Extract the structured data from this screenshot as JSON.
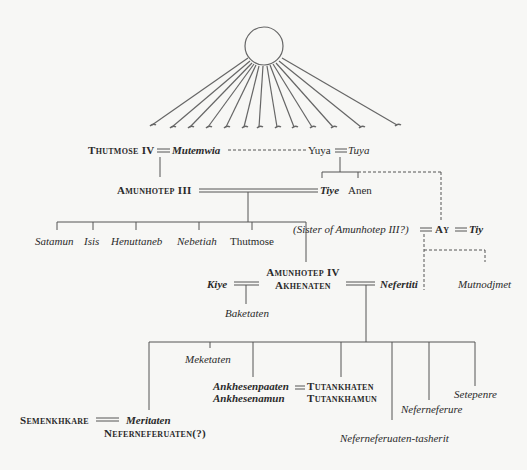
{
  "diagram": {
    "type": "family-tree",
    "symbol": "aten-sun-disc-with-rays",
    "nodes": {
      "thutmose_iv": "Thutmose IV",
      "mutemwia": "Mutemwia",
      "yuya": "Yuya",
      "tuya": "Tuya",
      "amunhotep_iii": "Amunhotep III",
      "tiye": "Tiye",
      "anen": "Anen",
      "sister": "(Sister of Amunhotep III?)",
      "ay": "Ay",
      "tiy": "Tiy",
      "satamun": "Satamun",
      "isis": "Isis",
      "henuttaneb": "Henuttaneb",
      "nebetiah": "Nebetiah",
      "thutmose": "Thutmose",
      "kiye": "Kiye",
      "amunhotep_iv": "Amunhotep IV",
      "akhenaten": "Akhenaten",
      "nefertiti": "Nefertiti",
      "mutnodjmet": "Mutnodjmet",
      "baketaten": "Baketaten",
      "meketaten": "Meketaten",
      "ankhesenpaaten": "Ankhesenpaaten",
      "ankhesenamun": "Ankhesenamun",
      "tutankhaten": "Tutankhaten",
      "tutankhamun": "Tutankhamun",
      "neferneferuaten_tasherit": "Neferneferuaten-tasherit",
      "neferneferure": "Neferneferure",
      "setepenre": "Setepenre",
      "semenkhkare": "Semenkhkare",
      "meritaten": "Meritaten",
      "neferneferuaten": "Neferneferuaten(?)"
    },
    "marriages": [
      [
        "Thutmose IV",
        "Mutemwia"
      ],
      [
        "Yuya",
        "Tuya"
      ],
      [
        "Amunhotep III",
        "Tiye"
      ],
      [
        "(Sister of Amunhotep III?)",
        "Ay"
      ],
      [
        "Ay",
        "Tiy"
      ],
      [
        "Kiye",
        "Amunhotep IV / Akhenaten"
      ],
      [
        "Amunhotep IV / Akhenaten",
        "Nefertiti"
      ],
      [
        "Ankhesenpaaten / Ankhesenamun",
        "Tutankhaten / Tutankhamun"
      ],
      [
        "Semenkhkare",
        "Meritaten / Neferneferuaten(?)"
      ]
    ],
    "colors": {
      "background": "#f7f7f5",
      "line": "#555555",
      "text": "#2a2a2a"
    }
  }
}
